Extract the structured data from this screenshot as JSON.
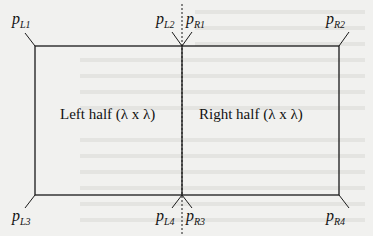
{
  "diagram": {
    "regions": [
      {
        "id": "left-half",
        "label": "Left half (λ x λ)"
      },
      {
        "id": "right-half",
        "label": "Right half (λ x λ)"
      }
    ],
    "points": [
      {
        "id": "pL1",
        "base": "p",
        "sub": "L1"
      },
      {
        "id": "pL2",
        "base": "p",
        "sub": "L2"
      },
      {
        "id": "pR1",
        "base": "p",
        "sub": "R1"
      },
      {
        "id": "pR2",
        "base": "p",
        "sub": "R2"
      },
      {
        "id": "pL3",
        "base": "p",
        "sub": "L3"
      },
      {
        "id": "pL4",
        "base": "p",
        "sub": "L4"
      },
      {
        "id": "pR3",
        "base": "p",
        "sub": "R3"
      },
      {
        "id": "pR4",
        "base": "p",
        "sub": "R4"
      }
    ]
  }
}
